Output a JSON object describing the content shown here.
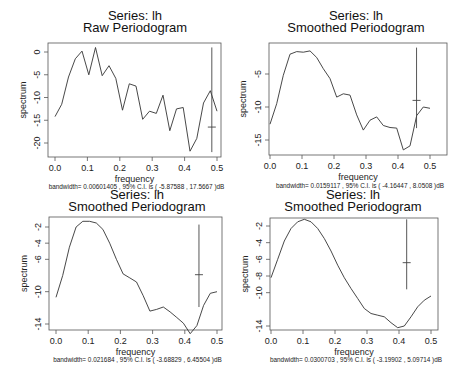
{
  "panels": [
    {
      "title1": "Series:  lh",
      "title2": "Raw Periodogram",
      "xlabel": "frequency",
      "ylabel": "spectrum",
      "footnote": "bandwidth= 0.00601405 , 95% C.I. is ( -5.87588 , 17.5667 )dB",
      "xticks": [
        "0.0",
        "0.1",
        "0.2",
        "0.3",
        "0.4",
        "0.5"
      ],
      "yticks": [
        "0",
        "-5",
        "-10",
        "-15",
        "-20"
      ]
    },
    {
      "title1": "Series:  lh",
      "title2": "Smoothed Periodogram",
      "xlabel": "frequency",
      "ylabel": "spectrum",
      "footnote": "bandwidth= 0.0159117 , 95% C.I. is ( -4.16447 , 8.0508 )dB",
      "xticks": [
        "0.0",
        "0.1",
        "0.2",
        "0.3",
        "0.4",
        "0.5"
      ],
      "yticks": [
        "-5",
        "-10",
        "-15"
      ]
    },
    {
      "title1": "Series:  lh",
      "title2": "Smoothed Periodogram",
      "xlabel": "frequency",
      "ylabel": "spectrum",
      "footnote": "bandwidth= 0.021684 , 95% C.I. is ( -3.68829 , 6.45504 )dB",
      "xticks": [
        "0.0",
        "0.1",
        "0.2",
        "0.3",
        "0.4",
        "0.5"
      ],
      "yticks": [
        "-2",
        "-4",
        "-6",
        "-10",
        "-14"
      ]
    },
    {
      "title1": "Series:  lh",
      "title2": "Smoothed Periodogram",
      "xlabel": "frequency",
      "ylabel": "spectrum",
      "footnote": "bandwidth= 0.0300703 , 95% C.I. is ( -3.19902 , 5.09714 )dB",
      "xticks": [
        "0.0",
        "0.1",
        "0.2",
        "0.3",
        "0.4",
        "0.5"
      ],
      "yticks": [
        "-2",
        "-4",
        "-6",
        "-8",
        "-10",
        "-14"
      ]
    }
  ],
  "chart_data": [
    {
      "type": "line",
      "title": "Series:  lh — Raw Periodogram",
      "xlabel": "frequency",
      "ylabel": "spectrum",
      "xlim": [
        0,
        0.5
      ],
      "ylim": [
        -22,
        1.5
      ],
      "grid": false,
      "x": [
        0.0208,
        0.0417,
        0.0625,
        0.0833,
        0.1042,
        0.125,
        0.1458,
        0.1667,
        0.1875,
        0.2083,
        0.2292,
        0.25,
        0.2708,
        0.2917,
        0.3125,
        0.3333,
        0.3542,
        0.375,
        0.3958,
        0.4167,
        0.4375,
        0.4583,
        0.4792,
        0.5
      ],
      "values": [
        -14.2,
        -11.5,
        -5.5,
        -1.5,
        0.2,
        -5.0,
        1.0,
        -5.2,
        -3.0,
        -5.8,
        -12.8,
        -7.0,
        -7.5,
        -14.8,
        -13.0,
        -13.5,
        -9.5,
        -17.3,
        -12.5,
        -12.2,
        -21.8,
        -19.0,
        -11.2,
        -8.5,
        -13.0
      ],
      "ci_bar": {
        "x": 0.484,
        "center": -16.5,
        "upper": 1.0,
        "lower": -22.0
      },
      "footnote": "bandwidth= 0.00601405 , 95% C.I. is ( -5.87588 , 17.5667 )dB"
    },
    {
      "type": "line",
      "title": "Series:  lh — Smoothed Periodogram",
      "xlabel": "frequency",
      "ylabel": "spectrum",
      "xlim": [
        0,
        0.5
      ],
      "ylim": [
        -17,
        -1
      ],
      "grid": false,
      "x": [
        0.0,
        0.0208,
        0.0417,
        0.0625,
        0.0833,
        0.1042,
        0.125,
        0.1458,
        0.1667,
        0.1875,
        0.2083,
        0.2292,
        0.25,
        0.2708,
        0.2917,
        0.3125,
        0.3333,
        0.3542,
        0.375,
        0.3958,
        0.4167,
        0.4375,
        0.4583,
        0.4792,
        0.5
      ],
      "values": [
        -12.6,
        -9.5,
        -5.2,
        -2.0,
        -1.6,
        -1.7,
        -1.5,
        -2.5,
        -4.2,
        -5.7,
        -8.5,
        -8.0,
        -8.2,
        -11.2,
        -13.5,
        -12.0,
        -11.5,
        -12.8,
        -13.1,
        -13.2,
        -16.5,
        -15.9,
        -11.3,
        -10.0,
        -10.2
      ],
      "ci_bar": {
        "x": 0.458,
        "center": -9.0,
        "upper": -1.0,
        "lower": -13.2
      },
      "footnote": "bandwidth= 0.0159117 , 95% C.I. is ( -4.16447 , 8.0508 )dB"
    },
    {
      "type": "line",
      "title": "Series:  lh — Smoothed Periodogram",
      "xlabel": "frequency",
      "ylabel": "spectrum",
      "xlim": [
        0,
        0.5
      ],
      "ylim": [
        -15,
        -1
      ],
      "grid": false,
      "x": [
        0.0,
        0.0208,
        0.0417,
        0.0625,
        0.0833,
        0.1042,
        0.125,
        0.1458,
        0.1667,
        0.1875,
        0.2083,
        0.2292,
        0.25,
        0.2708,
        0.2917,
        0.3125,
        0.3333,
        0.3542,
        0.375,
        0.3958,
        0.4167,
        0.4375,
        0.4583,
        0.4792,
        0.5
      ],
      "values": [
        -10.7,
        -8.0,
        -4.5,
        -2.0,
        -1.3,
        -1.3,
        -1.5,
        -2.3,
        -4.0,
        -6.0,
        -7.8,
        -8.3,
        -8.8,
        -10.5,
        -12.4,
        -12.2,
        -11.9,
        -12.5,
        -13.2,
        -13.9,
        -15.2,
        -14.2,
        -11.7,
        -10.2,
        -10.0
      ],
      "ci_bar": {
        "x": 0.444,
        "center": -7.9,
        "upper": -1.7,
        "lower": -11.9
      },
      "footnote": "bandwidth= 0.021684 , 95% C.I. is ( -3.68829 , 6.45504 )dB"
    },
    {
      "type": "line",
      "title": "Series:  lh — Smoothed Periodogram",
      "xlabel": "frequency",
      "ylabel": "spectrum",
      "xlim": [
        0,
        0.5
      ],
      "ylim": [
        -14.5,
        -1
      ],
      "grid": false,
      "x": [
        0.0,
        0.0208,
        0.0417,
        0.0625,
        0.0833,
        0.1042,
        0.125,
        0.1458,
        0.1667,
        0.1875,
        0.2083,
        0.2292,
        0.25,
        0.2708,
        0.2917,
        0.3125,
        0.3333,
        0.3542,
        0.375,
        0.3958,
        0.4167,
        0.4375,
        0.4583,
        0.4792,
        0.5
      ],
      "values": [
        -8.2,
        -6.0,
        -3.8,
        -2.3,
        -1.5,
        -1.2,
        -1.5,
        -2.3,
        -3.5,
        -5.0,
        -6.7,
        -8.2,
        -9.5,
        -10.7,
        -11.9,
        -12.5,
        -12.7,
        -12.9,
        -13.6,
        -14.2,
        -14.0,
        -12.9,
        -11.7,
        -10.9,
        -10.4
      ],
      "ci_bar": {
        "x": 0.424,
        "center": -6.4,
        "upper": -1.2,
        "lower": -9.6
      },
      "footnote": "bandwidth= 0.0300703 , 95% C.I. is ( -3.19902 , 5.09714 )dB"
    }
  ]
}
